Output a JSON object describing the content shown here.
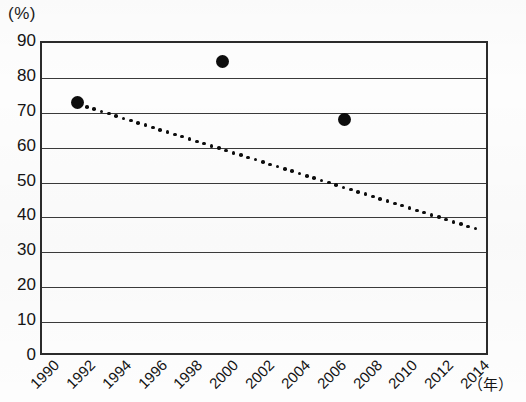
{
  "chart_data": {
    "type": "scatter",
    "title": "",
    "subtitle": "",
    "xlabel": "（年）",
    "ylabel": "(%)",
    "xlim": [
      1990,
      2015
    ],
    "ylim": [
      0,
      90
    ],
    "grid": true,
    "legend": "none",
    "x_tick_labels": [
      "1990",
      "1992",
      "1994",
      "1996",
      "1998",
      "2000",
      "2002",
      "2004",
      "2006",
      "2008",
      "2010",
      "2012",
      "2014"
    ],
    "x_tick_values": [
      1990,
      1992,
      1994,
      1996,
      1998,
      2000,
      2002,
      2004,
      2006,
      2008,
      2010,
      2012,
      2014
    ],
    "y_tick_labels": [
      "0",
      "10",
      "20",
      "30",
      "40",
      "50",
      "60",
      "70",
      "80",
      "90"
    ],
    "y_tick_values": [
      0,
      10,
      20,
      30,
      40,
      50,
      60,
      70,
      80,
      90
    ],
    "series": [
      {
        "name": "observations",
        "style": "scatter",
        "marker": "filled-circle",
        "color": "#0d0d0d",
        "points": [
          {
            "x": 1992.1,
            "y": 72.5
          },
          {
            "x": 2000.2,
            "y": 84.0
          },
          {
            "x": 2007.0,
            "y": 67.5
          }
        ]
      },
      {
        "name": "trend",
        "style": "dotted-line",
        "color": "#0d0d0d",
        "points": [
          {
            "x": 1992.2,
            "y": 71.8
          },
          {
            "x": 2014.3,
            "y": 36.2
          }
        ]
      }
    ]
  },
  "axes": {
    "unit_label": "(%)",
    "x_unit_label": "（年）"
  }
}
